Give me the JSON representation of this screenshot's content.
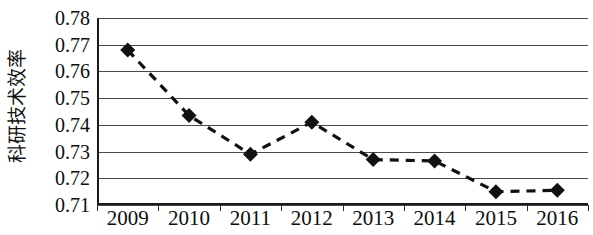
{
  "chart_data": {
    "type": "line",
    "title": "",
    "subtitle": "",
    "xlabel": "",
    "ylabel": "科研技术效率",
    "categories": [
      "2009",
      "2010",
      "2011",
      "2012",
      "2013",
      "2014",
      "2015",
      "2016"
    ],
    "values": [
      0.768,
      0.7435,
      0.729,
      0.741,
      0.727,
      0.7265,
      0.715,
      0.7155
    ],
    "series": [
      {
        "name": "科研技术效率",
        "values": [
          0.768,
          0.7435,
          0.729,
          0.741,
          0.727,
          0.7265,
          0.715,
          0.7155
        ]
      }
    ],
    "ylim": [
      0.71,
      0.78
    ],
    "ytick_labels": [
      "0.78",
      "0.77",
      "0.76",
      "0.75",
      "0.74",
      "0.73",
      "0.72",
      "0.71"
    ],
    "ytick_values": [
      0.78,
      0.77,
      0.76,
      0.75,
      0.74,
      0.73,
      0.72,
      0.71
    ],
    "grid": "horizontal",
    "legend": "none",
    "line_style": "dashed",
    "marker": "diamond",
    "series_color": "#111111",
    "grid_color": "#4a4a4a",
    "axis_color": "#1a1a1a"
  }
}
